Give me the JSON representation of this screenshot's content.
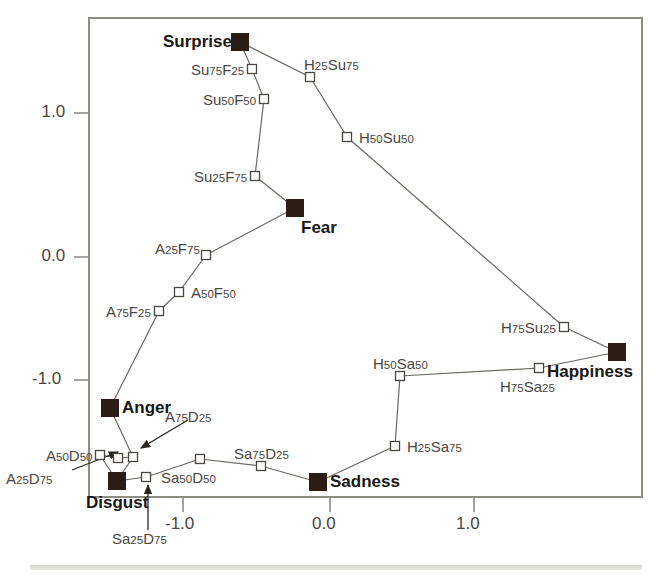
{
  "figure": {
    "kind": "scatter-network",
    "background": "#ffffff",
    "frame_color": "#8d8d86",
    "marker_fill_color": "#2b1d16",
    "marker_open_color": "#ffffff",
    "line_color": "#6b6660",
    "label_color": "#4a4641",
    "emotion_label_color": "#1b1714"
  },
  "axes": {
    "x_ticks": [
      {
        "label": "-1.0",
        "value": -1.0,
        "px": 183
      },
      {
        "label": "0.0",
        "value": 0.0,
        "px": 330
      },
      {
        "label": "1.0",
        "value": 1.0,
        "px": 474
      }
    ],
    "y_ticks": [
      {
        "label": "1.0",
        "value": 1.0,
        "px": 113
      },
      {
        "label": "0.0",
        "value": 0.0,
        "px": 257
      },
      {
        "label": "-1.0",
        "value": -1.0,
        "px": 380
      }
    ],
    "xlabel": "",
    "ylabel": "",
    "grid": false
  },
  "chart_data": {
    "type": "scatter",
    "title": "",
    "xlabel": "",
    "ylabel": "",
    "xlim": [
      -1.7,
      2.2
    ],
    "ylim": [
      -1.35,
      1.7
    ],
    "grid": false,
    "legend": "none",
    "series": [
      {
        "name": "prototype emotions",
        "marker": "filled-square",
        "points": [
          {
            "label": "Surprise",
            "x": -0.62,
            "y": 1.49,
            "px": 240,
            "py": 42,
            "label_pos": "left"
          },
          {
            "label": "Fear",
            "x": -0.24,
            "y": 0.34,
            "px": 295,
            "py": 208,
            "label_pos": "below-right"
          },
          {
            "label": "Anger",
            "x": -1.52,
            "y": -1.05,
            "px": 110,
            "py": 408,
            "label_pos": "right"
          },
          {
            "label": "Disgust",
            "x": -1.4,
            "y": -1.53,
            "px": 117,
            "py": 481,
            "label_pos": "below"
          },
          {
            "label": "Sadness",
            "x": -0.27,
            "y": -1.44,
            "px": 318,
            "py": 482,
            "label_pos": "right"
          },
          {
            "label": "Happiness",
            "x": 1.98,
            "y": -0.65,
            "px": 617,
            "py": 352,
            "label_pos": "below-left"
          }
        ]
      },
      {
        "name": "morph blends",
        "marker": "open-square",
        "points": [
          {
            "label": "Su75F25",
            "x": -0.55,
            "y": 1.3,
            "px": 252,
            "py": 69,
            "label_pos": "left"
          },
          {
            "label": "Su50F50",
            "x": -0.47,
            "y": 1.1,
            "px": 264,
            "py": 99,
            "label_pos": "left"
          },
          {
            "label": "Su25F75",
            "x": -0.46,
            "y": 0.62,
            "px": 255,
            "py": 176,
            "label_pos": "left"
          },
          {
            "label": "H25Su75",
            "x": -0.23,
            "y": 1.33,
            "px": 310,
            "py": 77,
            "label_pos": "above-right"
          },
          {
            "label": "H50Su50",
            "x": 0.02,
            "y": 0.94,
            "px": 347,
            "py": 137,
            "label_pos": "right"
          },
          {
            "label": "H75Su25",
            "x": 1.33,
            "y": -0.58,
            "px": 564,
            "py": 327,
            "label_pos": "left"
          },
          {
            "label": "A25F75",
            "x": -0.82,
            "y": 0.0,
            "px": 206,
            "py": 255,
            "label_pos": "above-left"
          },
          {
            "label": "A50F50",
            "x": -1.0,
            "y": -0.24,
            "px": 179,
            "py": 292,
            "label_pos": "right"
          },
          {
            "label": "A75F25",
            "x": -1.14,
            "y": -0.39,
            "px": 159,
            "py": 311,
            "label_pos": "left"
          },
          {
            "label": "A50D50",
            "x": -1.55,
            "y": -1.4,
            "px": 100,
            "py": 455,
            "label_pos": "left"
          },
          {
            "label": "A25D75",
            "x": -1.42,
            "y": -1.42,
            "px": 118,
            "py": 458,
            "label_pos": "arrow-lower-left"
          },
          {
            "label": "A75D25",
            "x": -1.34,
            "y": -1.41,
            "px": 133,
            "py": 457,
            "label_pos": "arrow-upper-right"
          },
          {
            "label": "Sa25D75",
            "x": -1.2,
            "y": -1.48,
            "px": 146,
            "py": 477,
            "label_pos": "arrow-below"
          },
          {
            "label": "Sa50D50",
            "x": -0.88,
            "y": -1.27,
            "px": 200,
            "py": 459,
            "label_pos": "below-left"
          },
          {
            "label": "Sa75D25",
            "x": -0.47,
            "y": -1.32,
            "px": 261,
            "py": 466,
            "label_pos": "above"
          },
          {
            "label": "H25Sa75",
            "x": 0.32,
            "y": -1.2,
            "px": 395,
            "py": 446,
            "label_pos": "right"
          },
          {
            "label": "H50Sa50",
            "x": 0.36,
            "y": -0.83,
            "px": 400,
            "py": 376,
            "label_pos": "above"
          },
          {
            "label": "H75Sa25",
            "x": 1.15,
            "y": -0.7,
            "px": 539,
            "py": 368,
            "label_pos": "below-left"
          }
        ]
      }
    ],
    "edges": [
      [
        "Surprise",
        "Su75F25"
      ],
      [
        "Su75F25",
        "Su50F50"
      ],
      [
        "Su50F50",
        "Su25F75"
      ],
      [
        "Su25F75",
        "Fear"
      ],
      [
        "Surprise",
        "H25Su75"
      ],
      [
        "H25Su75",
        "H50Su50"
      ],
      [
        "H50Su50",
        "H75Su25"
      ],
      [
        "H75Su25",
        "Happiness"
      ],
      [
        "Fear",
        "A25F75"
      ],
      [
        "A25F75",
        "A50F50"
      ],
      [
        "A50F50",
        "A75F25"
      ],
      [
        "A75F25",
        "Anger"
      ],
      [
        "Anger",
        "A75D25"
      ],
      [
        "A75D25",
        "A25D75"
      ],
      [
        "A25D75",
        "A50D50"
      ],
      [
        "A50D50",
        "Disgust"
      ],
      [
        "A75D25",
        "Disgust"
      ],
      [
        "Disgust",
        "Sa25D75"
      ],
      [
        "Sa25D75",
        "Sa50D50"
      ],
      [
        "Sa50D50",
        "Sa75D25"
      ],
      [
        "Sa75D25",
        "Sadness"
      ],
      [
        "Sadness",
        "H25Sa75"
      ],
      [
        "H25Sa75",
        "H50Sa50"
      ],
      [
        "H50Sa50",
        "H75Sa25"
      ],
      [
        "H75Sa25",
        "Happiness"
      ]
    ],
    "annotation_arrows": [
      {
        "from_label": "A25D75",
        "tail_px": [
          72,
          470
        ],
        "head_px": [
          118,
          452
        ]
      },
      {
        "from_label": "A75D25",
        "tail_px": [
          188,
          420
        ],
        "head_px": [
          141,
          448
        ]
      },
      {
        "from_label": "Sa25D75",
        "tail_px": [
          148,
          530
        ],
        "head_px": [
          148,
          485
        ]
      }
    ]
  }
}
